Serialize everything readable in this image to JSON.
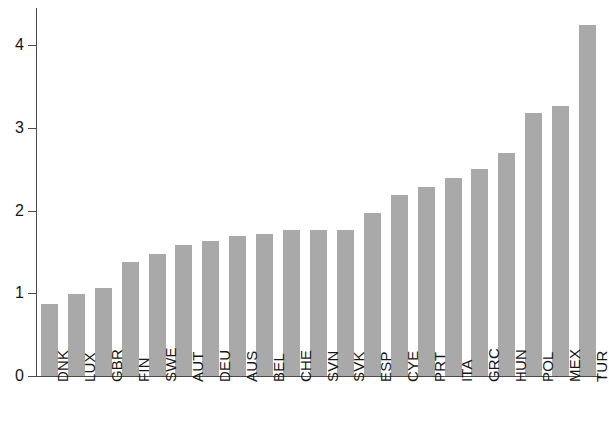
{
  "chart_data": {
    "type": "bar",
    "title": "",
    "subtitle": "",
    "xlabel": "",
    "ylabel": "",
    "categories": [
      "DNK",
      "LUX",
      "GBR",
      "FIN",
      "SWE",
      "AUT",
      "DEU",
      "AUS",
      "BEL",
      "CHE",
      "SVN",
      "SVK",
      "ESP",
      "CYE",
      "PRT",
      "ITA",
      "GRC",
      "HUN",
      "POL",
      "MEX",
      "TUR"
    ],
    "values": [
      0.87,
      0.99,
      1.07,
      1.38,
      1.47,
      1.59,
      1.63,
      1.69,
      1.72,
      1.77,
      1.77,
      1.77,
      1.97,
      2.19,
      2.28,
      2.39,
      2.5,
      2.7,
      3.18,
      3.27,
      4.25
    ],
    "series": [
      {
        "name": "value",
        "values": [
          0.87,
          0.99,
          1.07,
          1.38,
          1.47,
          1.59,
          1.63,
          1.69,
          1.72,
          1.77,
          1.77,
          1.77,
          1.97,
          2.19,
          2.28,
          2.39,
          2.5,
          2.7,
          3.18,
          3.27,
          4.25
        ]
      }
    ],
    "ylim": [
      0,
      4.45
    ],
    "yticks": [
      0,
      1,
      2,
      3,
      4
    ],
    "ytick_labels": [
      "0",
      "1",
      "2",
      "3",
      "4"
    ],
    "grid": false,
    "legend": null,
    "legend_position": "none",
    "bar_color": "#a9a9a9",
    "axis_color": "#4a4a4a",
    "background_color": "#ffffff",
    "annotations": []
  }
}
